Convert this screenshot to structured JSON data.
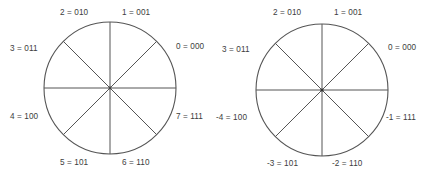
{
  "figure": {
    "type": "number-wheel-pair",
    "background_color": "#ffffff",
    "stroke_color": "#555555",
    "text_color": "#3d3d3d"
  },
  "diagrams": [
    {
      "id": "unsigned",
      "name": "unsigned-3-bit-number-wheel",
      "labels": [
        {
          "name": "label-0",
          "text": "0 = 000",
          "angle_deg": 0,
          "position": "right"
        },
        {
          "name": "label-1",
          "text": "1 = 001",
          "angle_deg": 45,
          "position": "top-right"
        },
        {
          "name": "label-2",
          "text": "2 = 010",
          "angle_deg": 90,
          "position": "top-left"
        },
        {
          "name": "label-3",
          "text": "3 = 011",
          "angle_deg": 135,
          "position": "left-upper"
        },
        {
          "name": "label-4",
          "text": "4 = 100",
          "angle_deg": 180,
          "position": "left-lower"
        },
        {
          "name": "label-5",
          "text": "5 = 101",
          "angle_deg": 225,
          "position": "bottom-left"
        },
        {
          "name": "label-6",
          "text": "6 = 110",
          "angle_deg": 270,
          "position": "bottom-right"
        },
        {
          "name": "label-7",
          "text": "7 = 111",
          "angle_deg": 315,
          "position": "right-lower"
        }
      ]
    },
    {
      "id": "signed",
      "name": "signed-twos-complement-3-bit-number-wheel",
      "labels": [
        {
          "name": "label-0",
          "text": "0 = 000",
          "angle_deg": 0,
          "position": "right"
        },
        {
          "name": "label-1",
          "text": "1 = 001",
          "angle_deg": 45,
          "position": "top-right"
        },
        {
          "name": "label-2",
          "text": "2 = 010",
          "angle_deg": 90,
          "position": "top-left"
        },
        {
          "name": "label-3",
          "text": "3 = 011",
          "angle_deg": 135,
          "position": "left-upper"
        },
        {
          "name": "label-m4",
          "text": "-4 = 100",
          "angle_deg": 180,
          "position": "left-lower"
        },
        {
          "name": "label-m3",
          "text": "-3 = 101",
          "angle_deg": 225,
          "position": "bottom-left"
        },
        {
          "name": "label-m2",
          "text": "-2 = 110",
          "angle_deg": 270,
          "position": "bottom-right"
        },
        {
          "name": "label-m1",
          "text": "-1 = 111",
          "angle_deg": 315,
          "position": "right-lower"
        }
      ]
    }
  ]
}
